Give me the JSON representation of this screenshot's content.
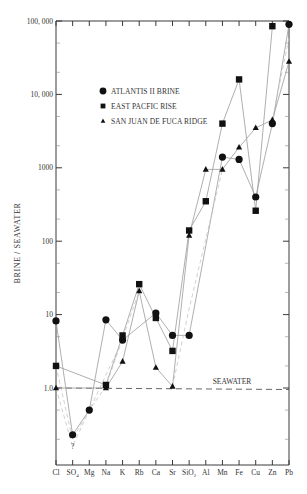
{
  "chart_data": {
    "type": "line",
    "title": "",
    "xlabel": "",
    "ylabel": "BRINE / SEAWATER",
    "yscale": "log",
    "ylim": [
      0.1,
      100000
    ],
    "y_ticks": [
      {
        "value": 100000,
        "label": "100, 000"
      },
      {
        "value": 10000,
        "label": "10, 000"
      },
      {
        "value": 1000,
        "label": "1000"
      },
      {
        "value": 100,
        "label": "100"
      },
      {
        "value": 10,
        "label": "10"
      },
      {
        "value": 1,
        "label": "1.0"
      }
    ],
    "categories": [
      "Cl",
      "SO4",
      "Mg",
      "Na",
      "K",
      "Rb",
      "Ca",
      "Sr",
      "SiO2",
      "Al",
      "Mn",
      "Fe",
      "Cu",
      "Zn",
      "Pb"
    ],
    "category_labels": [
      {
        "base": "Cl",
        "sub": ""
      },
      {
        "base": "SO",
        "sub": "4"
      },
      {
        "base": "Mg",
        "sub": ""
      },
      {
        "base": "Na",
        "sub": ""
      },
      {
        "base": "K",
        "sub": ""
      },
      {
        "base": "Rb",
        "sub": ""
      },
      {
        "base": "Ca",
        "sub": ""
      },
      {
        "base": "Sr",
        "sub": ""
      },
      {
        "base": "SiO",
        "sub": "2"
      },
      {
        "base": "Al",
        "sub": ""
      },
      {
        "base": "Mn",
        "sub": ""
      },
      {
        "base": "Fe",
        "sub": ""
      },
      {
        "base": "Cu",
        "sub": ""
      },
      {
        "base": "Zn",
        "sub": ""
      },
      {
        "base": "Pb",
        "sub": ""
      }
    ],
    "series": [
      {
        "name": "ATLANTIS II BRINE",
        "marker": "circle",
        "values": [
          8.2,
          0.23,
          0.5,
          8.5,
          4.5,
          null,
          10.5,
          5.2,
          5.2,
          null,
          1400,
          1300,
          400,
          4000,
          90000
        ]
      },
      {
        "name": "EAST PACFIC RISE",
        "marker": "square",
        "values": [
          2.0,
          null,
          null,
          1.1,
          5.2,
          26,
          9.0,
          3.2,
          140,
          350,
          4000,
          16000,
          260,
          85000,
          null
        ]
      },
      {
        "name": "SAN JUAN DE FUCA RIDGE",
        "marker": "triangle",
        "values": [
          1.0,
          null,
          null,
          1.0,
          2.3,
          21,
          1.9,
          1.05,
          120,
          950,
          950,
          1900,
          3500,
          4500,
          28000
        ]
      }
    ],
    "reference_line": {
      "value": 1.0,
      "label": "SEAWATER",
      "style": "dashed"
    },
    "annotations": [
      {
        "text": "?",
        "category": "SO4",
        "value": 0.16
      }
    ],
    "legend_position": "upper-left-inside",
    "grid": false
  },
  "legend": {
    "items": [
      {
        "label": "ATLANTIS II BRINE",
        "marker": "circle"
      },
      {
        "label": "EAST PACFIC RISE",
        "marker": "square"
      },
      {
        "label": "SAN JUAN DE FUCA RIDGE",
        "marker": "triangle"
      }
    ]
  },
  "colors": {
    "axis": "#3a3a3a",
    "line": "#9a9a9a",
    "dashed_line": "#c4c4c4",
    "marker": "#111111",
    "text": "#333333"
  }
}
